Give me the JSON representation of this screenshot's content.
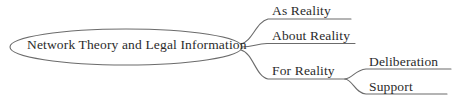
{
  "diagram": {
    "type": "mind-map",
    "title": "Network Theory and Legal Information",
    "background_color": "#ffffff",
    "stroke_color": "#6b6b6b",
    "text_color": "#2b2b2b",
    "root": {
      "label": "Network Theory and Legal Information",
      "shape": "ellipse"
    },
    "branches": [
      {
        "label": "As Reality",
        "children": []
      },
      {
        "label": "About Reality",
        "children": []
      },
      {
        "label": "For Reality",
        "children": [
          {
            "label": "Deliberation"
          },
          {
            "label": "Support"
          }
        ]
      }
    ]
  }
}
